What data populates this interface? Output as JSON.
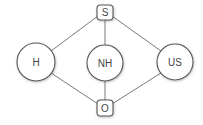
{
  "diagram": {
    "type": "graph",
    "colors": {
      "stroke": "#555555",
      "edge": "#6a6a6a",
      "text": "#444444",
      "fill": "#ffffff"
    },
    "nodes": {
      "S": {
        "label": "S",
        "shape": "rounded-square",
        "cx": 105,
        "cy": 12,
        "w": 16,
        "h": 15
      },
      "H": {
        "label": "H",
        "shape": "circle",
        "cx": 36,
        "cy": 62,
        "r": 19
      },
      "NH": {
        "label": "NH",
        "shape": "circle",
        "cx": 105,
        "cy": 63,
        "r": 18
      },
      "US": {
        "label": "US",
        "shape": "circle",
        "cx": 175,
        "cy": 62,
        "r": 18
      },
      "O": {
        "label": "O",
        "shape": "rounded-square",
        "cx": 105,
        "cy": 108,
        "w": 16,
        "h": 16
      }
    },
    "edges": [
      {
        "from": "S",
        "to": "H"
      },
      {
        "from": "S",
        "to": "NH"
      },
      {
        "from": "S",
        "to": "US"
      },
      {
        "from": "H",
        "to": "O"
      },
      {
        "from": "NH",
        "to": "O"
      },
      {
        "from": "US",
        "to": "O"
      }
    ]
  }
}
